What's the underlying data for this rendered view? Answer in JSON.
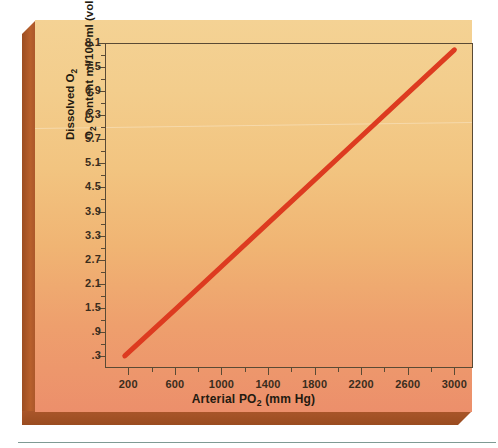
{
  "chart_data": {
    "type": "line",
    "title": "",
    "xlabel": "Arterial PO2 (mm Hg)",
    "ylabel": "Dissolved O2 / O2 Content ml/100 ml (vol.%)",
    "xlim": [
      0,
      3160
    ],
    "ylim": [
      0.0,
      8.1
    ],
    "grid": false,
    "legend": null,
    "x_ticks": [
      200,
      600,
      1000,
      1400,
      1800,
      2200,
      2600,
      3000
    ],
    "x_tick_labels": [
      "200",
      "600",
      "1000",
      "1400",
      "1800",
      "2200",
      "2600",
      "3000"
    ],
    "x_minor_step": 200,
    "y_ticks": [
      0.3,
      0.9,
      1.5,
      2.1,
      2.7,
      3.3,
      3.9,
      4.5,
      5.1,
      5.7,
      6.3,
      6.9,
      7.5,
      8.1
    ],
    "y_tick_labels": [
      ".3",
      ".9",
      "1.5",
      "2.1",
      "2.7",
      "3.3",
      "3.9",
      "4.5",
      "5.1",
      "5.7",
      "6.3",
      "6.9",
      "7.5",
      "8.1"
    ],
    "y_minor_step": 0.3,
    "series": [
      {
        "name": "Dissolved O2 content",
        "color": "#dd3b20",
        "x": [
          170,
          600,
          1000,
          1400,
          1800,
          2200,
          2600,
          3000
        ],
        "values": [
          0.3,
          1.45,
          2.53,
          3.61,
          4.69,
          5.77,
          6.85,
          7.93
        ],
        "line_width_px": 5
      }
    ]
  },
  "axes": {
    "y_title_line1": "Dissolved O",
    "y_title_line1_sub": "2",
    "y_title_line2_a": "O",
    "y_title_line2_sub": "2",
    "y_title_line2_b": " Content ml/100 ml (vol.%)",
    "x_title_a": "Arterial P",
    "x_title_sub": "O",
    "x_title_sub2": "2",
    "x_title_b": " (mm Hg)"
  },
  "style": {
    "accent_red": "#dd3b20",
    "card_top_color": "#f4d294",
    "card_bottom_color": "#ec8f6b",
    "bevel_color": "#a9562a",
    "axis_color": "#5a4a34",
    "text_color": "#231a10",
    "rule_color": "#7f9a94"
  }
}
